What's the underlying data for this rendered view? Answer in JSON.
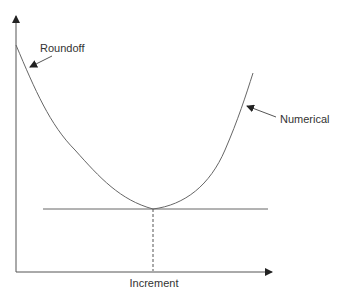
{
  "diagram": {
    "labels": {
      "roundoff": "Roundoff",
      "numerical": "Numerical",
      "xaxis": "Increment"
    },
    "colors": {
      "line": "#555555",
      "text": "#333333",
      "background": "#ffffff"
    }
  }
}
